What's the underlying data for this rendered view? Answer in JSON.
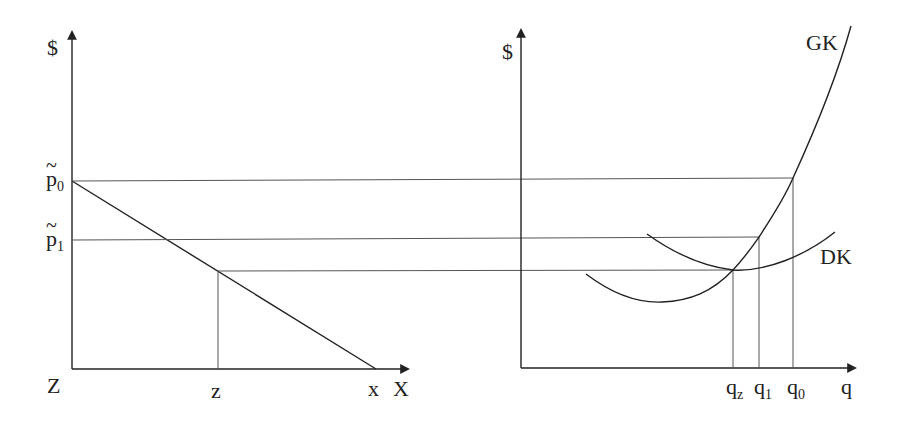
{
  "left_panel": {
    "y_axis_label": "$",
    "x_axis_label": "X",
    "origin_label": "Z",
    "y_ticks": [
      {
        "base": "p",
        "sub": "0",
        "tilde": true,
        "label": "p̃0"
      },
      {
        "base": "p",
        "sub": "1",
        "tilde": true,
        "label": "p̃1"
      }
    ],
    "x_ticks": [
      {
        "label": "z"
      },
      {
        "label": "x"
      }
    ]
  },
  "right_panel": {
    "y_axis_label": "$",
    "x_axis_label": "q",
    "curves": [
      {
        "name": "GK",
        "label": "GK"
      },
      {
        "name": "DK",
        "label": "DK"
      }
    ],
    "x_ticks": [
      {
        "base": "q",
        "sub": "z",
        "label": "q_z"
      },
      {
        "base": "q",
        "sub": "1",
        "label": "q_1"
      },
      {
        "base": "q",
        "sub": "0",
        "label": "q_0"
      }
    ]
  },
  "colors": {
    "ink": "#222222",
    "guide": "#555555",
    "background": "#ffffff"
  }
}
